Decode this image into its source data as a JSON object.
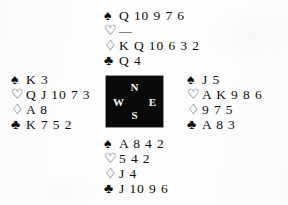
{
  "diagram": {
    "type": "bridge-deal",
    "suit_glyphs": {
      "spade": "♠",
      "heart": "♡",
      "diamond": "♢",
      "club": "♣"
    },
    "compass": {
      "north": "N",
      "west": "W",
      "east": "E",
      "south": "S",
      "box_color": "#0a0a0a",
      "letter_color": "#f6f6f6"
    },
    "hands": {
      "north": {
        "label": "North",
        "spades": "Q 10 9 7 6",
        "hearts": "—",
        "diamonds": "K Q 10 6 3 2",
        "clubs": "Q 4"
      },
      "west": {
        "label": "West",
        "spades": "K 3",
        "hearts": "Q J 10 7 3",
        "diamonds": "A 8",
        "clubs": "K 7 5 2"
      },
      "east": {
        "label": "East",
        "spades": "J 5",
        "hearts": "A K 9 8 6",
        "diamonds": "9 7 5",
        "clubs": "A 8 3"
      },
      "south": {
        "label": "South",
        "spades": "A 8 4 2",
        "hearts": "5 4 2",
        "diamonds": "J 4",
        "clubs": "J 10 9 6"
      }
    }
  }
}
